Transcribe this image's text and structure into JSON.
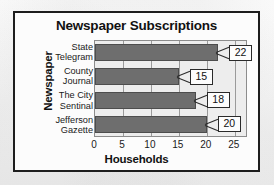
{
  "chart_data": {
    "type": "bar",
    "orientation": "horizontal",
    "title": "Newspaper Subscriptions",
    "xlabel": "Households",
    "ylabel": "Newspaper",
    "categories": [
      "State Telegram",
      "County Journal",
      "The City Sentinal",
      "Jefferson Gazette"
    ],
    "category_lines": [
      [
        "State",
        "Telegram"
      ],
      [
        "County",
        "Journal"
      ],
      [
        "The City",
        "Sentinal"
      ],
      [
        "Jefferson",
        "Gazette"
      ]
    ],
    "values": [
      22,
      15,
      18,
      20
    ],
    "value_labels": [
      "22",
      "15",
      "18",
      "20"
    ],
    "xlim": [
      0,
      27
    ],
    "xticks": [
      0,
      5,
      10,
      15,
      20,
      25
    ],
    "xtick_labels": [
      "0",
      "5",
      "10",
      "15",
      "20",
      "25"
    ],
    "grid": "vertical",
    "legend": "none",
    "bar_color": "#6e6e6e",
    "plot_background": "#ededed",
    "frame_color": "#1d1d1d"
  },
  "ghost": {
    "bleed_text": "Newspaper Subscriptions"
  }
}
